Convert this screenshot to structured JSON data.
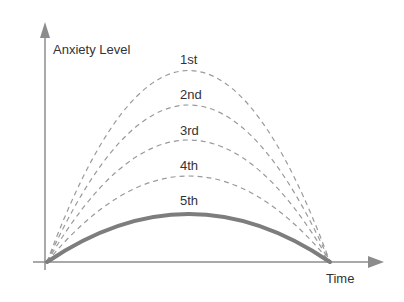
{
  "diagram": {
    "y_axis_label": "Anxiety Level",
    "x_axis_label": "Time",
    "colors": {
      "axis": "#8c8c8c",
      "dashed_curve": "#9a9a9a",
      "solid_curve": "#7d7d7d",
      "text": "#333333"
    },
    "curves": [
      {
        "label": "1st",
        "style": "dashed",
        "peak_y": 70
      },
      {
        "label": "2nd",
        "style": "dashed",
        "peak_y": 105
      },
      {
        "label": "3rd",
        "style": "dashed",
        "peak_y": 140
      },
      {
        "label": "4th",
        "style": "dashed",
        "peak_y": 176
      },
      {
        "label": "5th",
        "style": "solid",
        "peak_y": 214
      }
    ]
  }
}
